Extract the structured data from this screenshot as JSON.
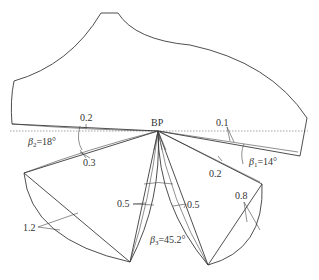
{
  "diagram": {
    "type": "cutting-tool-profile-with-rotated-blades",
    "pivot_label": "BP",
    "labels": {
      "top_left_offset": "0.2",
      "top_right_offset": "0.1",
      "left_lower_offset": "0.3",
      "right_lower_offset": "0.2",
      "left_large_offset": "1.2",
      "mid_left_offset": "0.5",
      "mid_right_offset": "0.5",
      "right_large_offset": "0.8"
    },
    "angles": {
      "beta1": {
        "symbol": "β",
        "sub": "1",
        "value": "=14°"
      },
      "beta2": {
        "symbol": "β",
        "sub": "2",
        "value": "=18°"
      },
      "beta3": {
        "symbol": "β",
        "sub": "3",
        "value": "=45.2°"
      }
    },
    "colors": {
      "line": "#3a3a3a",
      "dashed_reference": "#666666",
      "background": "#ffffff"
    }
  }
}
